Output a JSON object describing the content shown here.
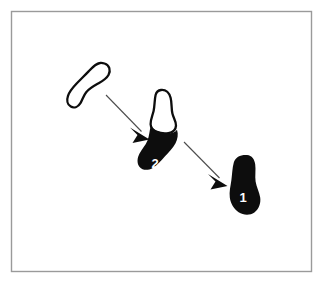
{
  "figure": {
    "name": "shape-transformation-sequence",
    "canvas": {
      "width": 324,
      "height": 289,
      "background": "#ffffff"
    },
    "frame": {
      "name": "figure-border",
      "x": 11.5,
      "y": 11.5,
      "width": 300,
      "height": 260,
      "stroke": "#9a9a9a",
      "stroke_width": 1.4,
      "fill": "#ffffff"
    },
    "colors": {
      "ink": "#0d0d0d",
      "paper": "#ffffff",
      "border": "#9a9a9a",
      "arrow": "#4d4d4d",
      "label_text": "#ffffff"
    },
    "shapes": [
      {
        "name": "blob-outline-unlabeled",
        "label": "",
        "fill_style": "outline",
        "description": "open contour foot-shaped blob, upper-left",
        "centroid": {
          "x": 92,
          "y": 86
        }
      },
      {
        "name": "blob-half-filled-2",
        "label": "2",
        "fill_style": "half-filled",
        "description": "foot-shaped blob, outline top and solid black bottom",
        "centroid": {
          "x": 161,
          "y": 132
        },
        "label_position": {
          "x": 155,
          "y": 163
        }
      },
      {
        "name": "blob-filled-1",
        "label": "1",
        "fill_style": "filled",
        "description": "solid black foot-shaped blob, lower-right",
        "centroid": {
          "x": 244,
          "y": 185
        },
        "label_position": {
          "x": 243,
          "y": 197
        }
      }
    ],
    "arrows": [
      {
        "name": "arrow-outline-to-2",
        "from_shape": "blob-outline-unlabeled",
        "to_shape": "blob-half-filled-2",
        "start": {
          "x": 106,
          "y": 95
        },
        "end": {
          "x": 148,
          "y": 138
        },
        "stroke": "#4d4d4d",
        "stroke_width": 1.1
      },
      {
        "name": "arrow-2-to-1",
        "from_shape": "blob-half-filled-2",
        "to_shape": "blob-filled-1",
        "start": {
          "x": 184,
          "y": 142
        },
        "end": {
          "x": 227,
          "y": 185
        },
        "stroke": "#4d4d4d",
        "stroke_width": 1.1
      }
    ]
  }
}
